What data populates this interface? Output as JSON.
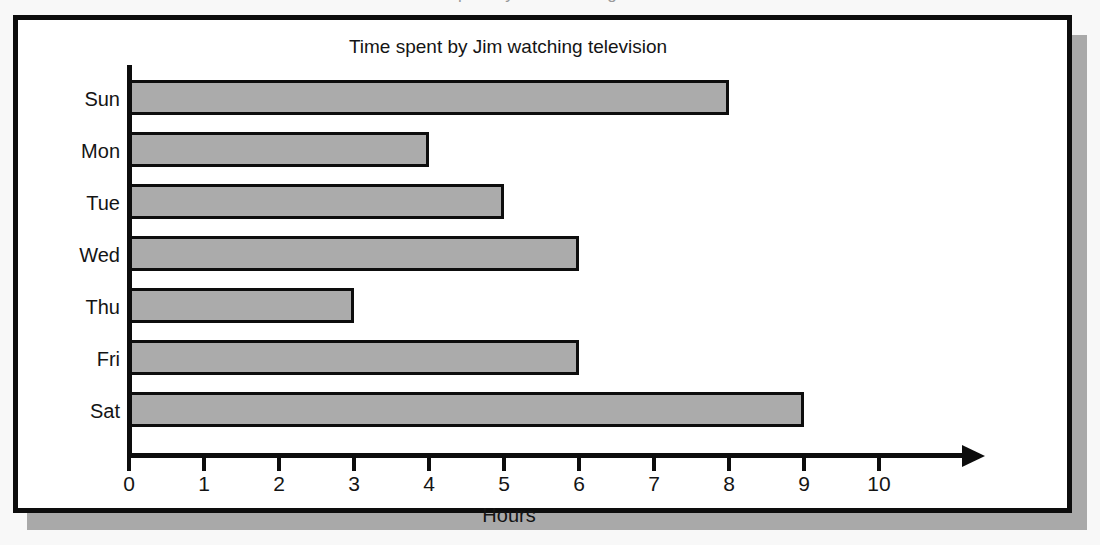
{
  "scan": {
    "top_fragment_text": "Time spent by Jim watching television"
  },
  "chart_data": {
    "type": "bar",
    "orientation": "horizontal",
    "title": "Time spent by Jim watching television",
    "xlabel": "Hours",
    "ylabel": "",
    "categories": [
      "Sun",
      "Mon",
      "Tue",
      "Wed",
      "Thu",
      "Fri",
      "Sat"
    ],
    "values": [
      8,
      4,
      5,
      6,
      3,
      6,
      9
    ],
    "xlim": [
      0,
      11
    ],
    "xticks": [
      0,
      1,
      2,
      3,
      4,
      5,
      6,
      7,
      8,
      9,
      10
    ],
    "xtick_labels": [
      "0",
      "1",
      "2",
      "3",
      "4",
      "5",
      "6",
      "7",
      "8",
      "9",
      "10"
    ],
    "grid": false,
    "legend": false,
    "bar_fill_color": "#ababab",
    "bar_edge_color": "#0d0d0d",
    "axis_color": "#0d0d0d",
    "background_color": "#ffffff",
    "frame_color": "#0d0d0d",
    "shadow_color": "#a9a9a9",
    "page_background_color": "#f8f8f8",
    "bars": [
      {
        "category": "Sun",
        "value": 8
      },
      {
        "category": "Mon",
        "value": 4
      },
      {
        "category": "Tue",
        "value": 5
      },
      {
        "category": "Wed",
        "value": 6
      },
      {
        "category": "Thu",
        "value": 3
      },
      {
        "category": "Fri",
        "value": 6
      },
      {
        "category": "Sat",
        "value": 9
      }
    ]
  }
}
